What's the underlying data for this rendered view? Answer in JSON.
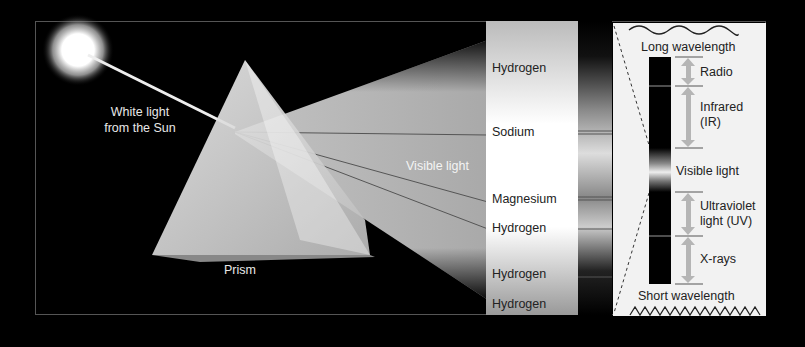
{
  "diagram": {
    "left_labels": {
      "sun": "White light\nfrom the Sun",
      "sun_line1": "White light",
      "sun_line2": "from the Sun",
      "prism": "Prism",
      "beam": "Visible light"
    },
    "spectrum_lines": [
      {
        "label": "Hydrogen",
        "y": 69
      },
      {
        "label": "Sodium",
        "y": 132
      },
      {
        "label": "Magnesium",
        "y": 200
      },
      {
        "label": "Hydrogen",
        "y": 229
      },
      {
        "label": "Hydrogen",
        "y": 274
      },
      {
        "label": "Hydrogen",
        "y": 305
      }
    ],
    "em_spectrum": {
      "top_label": "Long wavelength",
      "bottom_label": "Short wavelength",
      "bands": [
        {
          "label": "Radio"
        },
        {
          "label_line1": "Infrared",
          "label_line2": "(IR)"
        },
        {
          "label": "Visible light"
        },
        {
          "label_line1": "Ultraviolet",
          "label_line2": "light (UV)"
        },
        {
          "label": "X-rays"
        }
      ]
    },
    "colors": {
      "background": "#000000",
      "panel": "#f2f2f2",
      "arrow": "#b5b5b5",
      "frame": "#555555"
    }
  }
}
